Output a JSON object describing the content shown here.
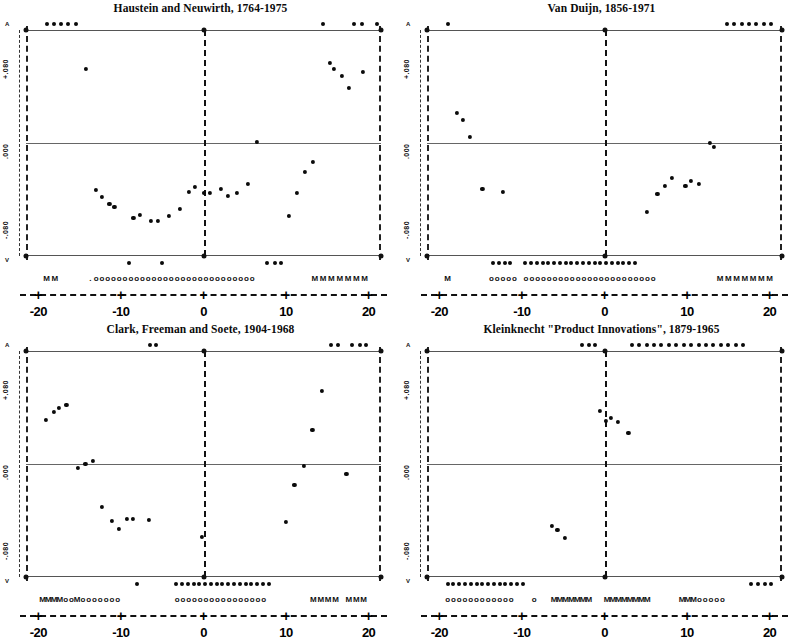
{
  "figure": {
    "panel_count": 4,
    "xlabel": "",
    "ylabel": ""
  },
  "axis": {
    "x_ticks": [
      "-20",
      "-10",
      "0",
      "10",
      "20"
    ],
    "x_tick_values": [
      -20,
      -10,
      0,
      10,
      20
    ],
    "x_tick_glyph": "+",
    "y_ticks": [
      "+.080",
      ".000",
      "-.080"
    ],
    "y_top_arrow": "A",
    "y_bottom_arrow": "V"
  },
  "chart_data": [
    {
      "type": "scatter",
      "title": "Haustein and Neuwirth, 1764-1975",
      "xlabel": "",
      "ylabel": "",
      "xlim": [
        -21.5,
        21.5
      ],
      "ylim": [
        -0.113,
        0.113
      ],
      "grid": false,
      "legend": "none",
      "gridlines_y": [
        0.08,
        0.0,
        -0.08
      ],
      "points": [
        {
          "x": -14.2,
          "y": 0.074
        },
        {
          "x": -13.0,
          "y": -0.047
        },
        {
          "x": -12.3,
          "y": -0.054
        },
        {
          "x": -11.4,
          "y": -0.061
        },
        {
          "x": -10.8,
          "y": -0.064
        },
        {
          "x": -8.5,
          "y": -0.075
        },
        {
          "x": -7.7,
          "y": -0.072
        },
        {
          "x": -6.4,
          "y": -0.078
        },
        {
          "x": -5.5,
          "y": -0.078
        },
        {
          "x": -4.2,
          "y": -0.073
        },
        {
          "x": -2.9,
          "y": -0.066
        },
        {
          "x": -1.8,
          "y": -0.049
        },
        {
          "x": -1.0,
          "y": -0.044
        },
        {
          "x": 0.0,
          "y": -0.05
        },
        {
          "x": 0.8,
          "y": -0.05
        },
        {
          "x": 2.1,
          "y": -0.046
        },
        {
          "x": 3.0,
          "y": -0.053
        },
        {
          "x": 4.0,
          "y": -0.05
        },
        {
          "x": 5.4,
          "y": -0.041
        },
        {
          "x": 6.5,
          "y": 0.001
        },
        {
          "x": 10.3,
          "y": -0.073
        },
        {
          "x": 11.3,
          "y": -0.05
        },
        {
          "x": 12.3,
          "y": -0.029
        },
        {
          "x": 13.3,
          "y": -0.019
        },
        {
          "x": 15.3,
          "y": 0.08
        },
        {
          "x": 15.8,
          "y": 0.074
        },
        {
          "x": 16.8,
          "y": 0.067
        },
        {
          "x": 17.6,
          "y": 0.055
        },
        {
          "x": 19.3,
          "y": 0.071
        }
      ],
      "clipped_above": [
        -19.0,
        -18.1,
        -17.3,
        -16.4,
        -15.4,
        14.5,
        18.2,
        19.2,
        21.0
      ],
      "clipped_below": [
        -9.0,
        -5.0,
        7.7,
        8.6,
        9.4
      ],
      "symbol_row": [
        {
          "x": -19.0,
          "s": "M"
        },
        {
          "x": -18.0,
          "s": "M"
        },
        {
          "x": -13.7,
          "s": "."
        },
        {
          "x": -13.0,
          "s": "o"
        },
        {
          "x": -12.3,
          "s": "o"
        },
        {
          "x": -11.6,
          "s": "o"
        },
        {
          "x": -10.9,
          "s": "o"
        },
        {
          "x": -10.2,
          "s": "o"
        },
        {
          "x": -9.5,
          "s": "o"
        },
        {
          "x": -8.8,
          "s": "o"
        },
        {
          "x": -8.1,
          "s": "o"
        },
        {
          "x": -7.4,
          "s": "o"
        },
        {
          "x": -6.7,
          "s": "o"
        },
        {
          "x": -6.0,
          "s": "o"
        },
        {
          "x": -5.3,
          "s": "o"
        },
        {
          "x": -4.6,
          "s": "o"
        },
        {
          "x": -3.9,
          "s": "o"
        },
        {
          "x": -3.2,
          "s": "o"
        },
        {
          "x": -2.5,
          "s": "o"
        },
        {
          "x": -1.8,
          "s": "o"
        },
        {
          "x": -1.1,
          "s": "o"
        },
        {
          "x": -0.4,
          "s": "o"
        },
        {
          "x": 0.3,
          "s": "o"
        },
        {
          "x": 1.0,
          "s": "o"
        },
        {
          "x": 1.7,
          "s": "o"
        },
        {
          "x": 2.4,
          "s": "o"
        },
        {
          "x": 3.1,
          "s": "o"
        },
        {
          "x": 3.8,
          "s": "o"
        },
        {
          "x": 4.5,
          "s": "o"
        },
        {
          "x": 5.2,
          "s": "o"
        },
        {
          "x": 5.9,
          "s": "o"
        },
        {
          "x": 13.5,
          "s": "M"
        },
        {
          "x": 14.5,
          "s": "M"
        },
        {
          "x": 15.5,
          "s": "M"
        },
        {
          "x": 16.5,
          "s": "M"
        },
        {
          "x": 17.5,
          "s": "M"
        },
        {
          "x": 18.5,
          "s": "M"
        },
        {
          "x": 19.5,
          "s": "M"
        }
      ]
    },
    {
      "type": "scatter",
      "title": "Van Duijn, 1856-1971",
      "xlabel": "",
      "ylabel": "",
      "xlim": [
        -21.5,
        21.5
      ],
      "ylim": [
        -0.113,
        0.113
      ],
      "grid": false,
      "legend": "none",
      "gridlines_y": [
        0.08,
        0.0,
        -0.08
      ],
      "points": [
        {
          "x": -17.9,
          "y": 0.03
        },
        {
          "x": -17.2,
          "y": 0.023
        },
        {
          "x": -16.3,
          "y": 0.006
        },
        {
          "x": -14.8,
          "y": -0.046
        },
        {
          "x": -12.3,
          "y": -0.049
        },
        {
          "x": 5.1,
          "y": -0.069
        },
        {
          "x": 6.4,
          "y": -0.051
        },
        {
          "x": 7.3,
          "y": -0.043
        },
        {
          "x": 8.2,
          "y": -0.035
        },
        {
          "x": 9.8,
          "y": -0.043
        },
        {
          "x": 10.5,
          "y": -0.038
        },
        {
          "x": 11.4,
          "y": -0.041
        },
        {
          "x": 12.8,
          "y": 0.0
        },
        {
          "x": 13.3,
          "y": -0.004
        }
      ],
      "clipped_above": [
        -19.0,
        14.8,
        15.7,
        16.6,
        17.5,
        18.4,
        19.3,
        20.2
      ],
      "clipped_below": [
        -13.5,
        -12.8,
        -12.1,
        -11.4,
        -9.6,
        -8.9,
        -8.2,
        -7.5,
        -6.8,
        -6.1,
        -5.4,
        -4.7,
        -4.0,
        -3.3,
        -2.6,
        -1.9,
        -1.2,
        -0.5,
        0.2,
        0.9,
        1.6,
        2.3,
        3.0,
        3.7
      ],
      "symbol_row": [
        {
          "x": -19.0,
          "s": "M"
        },
        {
          "x": -13.7,
          "s": "o"
        },
        {
          "x": -13.0,
          "s": "o"
        },
        {
          "x": -12.3,
          "s": "o"
        },
        {
          "x": -11.6,
          "s": "o"
        },
        {
          "x": -10.9,
          "s": "o"
        },
        {
          "x": -9.5,
          "s": "o"
        },
        {
          "x": -8.8,
          "s": "o"
        },
        {
          "x": -8.1,
          "s": "o"
        },
        {
          "x": -7.4,
          "s": "o"
        },
        {
          "x": -6.7,
          "s": "o"
        },
        {
          "x": -6.0,
          "s": "o"
        },
        {
          "x": -5.3,
          "s": "o"
        },
        {
          "x": -4.6,
          "s": "o"
        },
        {
          "x": -3.9,
          "s": "o"
        },
        {
          "x": -3.2,
          "s": "o"
        },
        {
          "x": -2.5,
          "s": "o"
        },
        {
          "x": -1.8,
          "s": "o"
        },
        {
          "x": -1.1,
          "s": "o"
        },
        {
          "x": -0.4,
          "s": "o"
        },
        {
          "x": 0.3,
          "s": "o"
        },
        {
          "x": 1.0,
          "s": "o"
        },
        {
          "x": 1.7,
          "s": "o"
        },
        {
          "x": 2.4,
          "s": "o"
        },
        {
          "x": 3.1,
          "s": "o"
        },
        {
          "x": 3.8,
          "s": "o"
        },
        {
          "x": 4.5,
          "s": "o"
        },
        {
          "x": 5.2,
          "s": "o"
        },
        {
          "x": 5.9,
          "s": "o"
        },
        {
          "x": 14.0,
          "s": "M"
        },
        {
          "x": 15.0,
          "s": "M"
        },
        {
          "x": 16.0,
          "s": "M"
        },
        {
          "x": 17.0,
          "s": "M"
        },
        {
          "x": 18.0,
          "s": "M"
        },
        {
          "x": 19.0,
          "s": "M"
        },
        {
          "x": 20.0,
          "s": "M"
        }
      ]
    },
    {
      "type": "scatter",
      "title": "Clark, Freeman and Soete, 1904-1968",
      "xlabel": "",
      "ylabel": "",
      "xlim": [
        -21.5,
        21.5
      ],
      "ylim": [
        -0.113,
        0.113
      ],
      "grid": false,
      "legend": "none",
      "gridlines_y": [
        0.08,
        0.0,
        -0.08
      ],
      "points": [
        {
          "x": -19.1,
          "y": 0.044
        },
        {
          "x": -18.1,
          "y": 0.052
        },
        {
          "x": -17.5,
          "y": 0.056
        },
        {
          "x": -16.6,
          "y": 0.059
        },
        {
          "x": -15.2,
          "y": -0.004
        },
        {
          "x": -14.3,
          "y": 0.0
        },
        {
          "x": -13.4,
          "y": 0.003
        },
        {
          "x": -12.3,
          "y": -0.043
        },
        {
          "x": -11.1,
          "y": -0.057
        },
        {
          "x": -10.2,
          "y": -0.065
        },
        {
          "x": -9.3,
          "y": -0.055
        },
        {
          "x": -8.6,
          "y": -0.055
        },
        {
          "x": -6.6,
          "y": -0.056
        },
        {
          "x": 10.0,
          "y": -0.058
        },
        {
          "x": 11.0,
          "y": -0.021
        },
        {
          "x": 12.2,
          "y": -0.002
        },
        {
          "x": 13.2,
          "y": 0.034
        },
        {
          "x": 14.3,
          "y": 0.073
        },
        {
          "x": 17.3,
          "y": -0.01
        },
        {
          "x": -0.2,
          "y": -0.073
        }
      ],
      "clipped_above": [
        -6.5,
        -5.7,
        15.5,
        16.3,
        18.0,
        18.9,
        19.7
      ],
      "clipped_below": [
        -8.0,
        -3.3,
        -2.6,
        -1.9,
        -1.2,
        -0.5,
        0.2,
        0.9,
        1.6,
        2.3,
        3.0,
        3.7,
        4.4,
        5.1,
        5.8,
        6.5,
        7.2,
        7.9
      ],
      "symbol_row": [
        {
          "x": -19.5,
          "s": "M"
        },
        {
          "x": -18.8,
          "s": "M"
        },
        {
          "x": -18.1,
          "s": "M"
        },
        {
          "x": -17.4,
          "s": "M"
        },
        {
          "x": -16.7,
          "s": "o"
        },
        {
          "x": -16.0,
          "s": "o"
        },
        {
          "x": -15.3,
          "s": "M"
        },
        {
          "x": -14.6,
          "s": "o"
        },
        {
          "x": -13.9,
          "s": "o"
        },
        {
          "x": -13.2,
          "s": "o"
        },
        {
          "x": -12.5,
          "s": "o"
        },
        {
          "x": -11.8,
          "s": "o"
        },
        {
          "x": -11.1,
          "s": "o"
        },
        {
          "x": -10.4,
          "s": "o"
        },
        {
          "x": -3.2,
          "s": "o"
        },
        {
          "x": -2.5,
          "s": "o"
        },
        {
          "x": -1.8,
          "s": "o"
        },
        {
          "x": -1.1,
          "s": "o"
        },
        {
          "x": -0.4,
          "s": "o"
        },
        {
          "x": 0.3,
          "s": "o"
        },
        {
          "x": 1.0,
          "s": "o"
        },
        {
          "x": 1.7,
          "s": "o"
        },
        {
          "x": 2.4,
          "s": "o"
        },
        {
          "x": 3.1,
          "s": "o"
        },
        {
          "x": 3.8,
          "s": "o"
        },
        {
          "x": 4.5,
          "s": "o"
        },
        {
          "x": 5.2,
          "s": "o"
        },
        {
          "x": 5.9,
          "s": "o"
        },
        {
          "x": 6.6,
          "s": "o"
        },
        {
          "x": 7.3,
          "s": "o"
        },
        {
          "x": 13.3,
          "s": "M"
        },
        {
          "x": 14.2,
          "s": "M"
        },
        {
          "x": 15.1,
          "s": "M"
        },
        {
          "x": 16.0,
          "s": "M"
        },
        {
          "x": 17.6,
          "s": "M"
        },
        {
          "x": 18.5,
          "s": "M"
        },
        {
          "x": 19.4,
          "s": "M"
        }
      ]
    },
    {
      "type": "scatter",
      "title": "Kleinknecht \"Product Innovations\", 1879-1965",
      "xlabel": "",
      "ylabel": "",
      "xlim": [
        -21.5,
        21.5
      ],
      "ylim": [
        -0.113,
        0.113
      ],
      "grid": false,
      "legend": "none",
      "gridlines_y": [
        0.08,
        0.0,
        -0.08
      ],
      "points": [
        {
          "x": -0.6,
          "y": 0.053
        },
        {
          "x": 0.2,
          "y": 0.043
        },
        {
          "x": 0.8,
          "y": 0.046
        },
        {
          "x": 1.6,
          "y": 0.042
        },
        {
          "x": 2.9,
          "y": 0.031
        },
        {
          "x": -6.4,
          "y": -0.062
        },
        {
          "x": -5.7,
          "y": -0.066
        },
        {
          "x": -4.8,
          "y": -0.074
        }
      ],
      "clipped_above": [
        -2.7,
        -1.9,
        -1.1,
        3.3,
        4.2,
        5.1,
        6.0,
        6.9,
        7.8,
        8.7,
        9.6,
        10.5,
        11.4,
        12.3,
        13.2,
        14.1,
        15.0,
        15.9,
        16.8
      ],
      "clipped_below": [
        -19.0,
        -18.3,
        -17.6,
        -16.9,
        -16.2,
        -15.5,
        -14.8,
        -14.1,
        -13.4,
        -12.7,
        -12.0,
        -11.3,
        -10.6,
        -9.9,
        17.8,
        18.6,
        19.4,
        20.2
      ],
      "symbol_row": [
        {
          "x": -19.0,
          "s": "o"
        },
        {
          "x": -18.3,
          "s": "o"
        },
        {
          "x": -17.6,
          "s": "o"
        },
        {
          "x": -16.9,
          "s": "o"
        },
        {
          "x": -16.2,
          "s": "o"
        },
        {
          "x": -15.5,
          "s": "o"
        },
        {
          "x": -14.8,
          "s": "o"
        },
        {
          "x": -14.1,
          "s": "o"
        },
        {
          "x": -13.4,
          "s": "o"
        },
        {
          "x": -12.7,
          "s": "o"
        },
        {
          "x": -12.0,
          "s": "o"
        },
        {
          "x": -11.3,
          "s": "o"
        },
        {
          "x": -8.5,
          "s": "o"
        },
        {
          "x": -6.1,
          "s": "M"
        },
        {
          "x": -5.4,
          "s": "M"
        },
        {
          "x": -4.7,
          "s": "M"
        },
        {
          "x": -4.0,
          "s": "M"
        },
        {
          "x": -3.3,
          "s": "M"
        },
        {
          "x": -2.6,
          "s": "M"
        },
        {
          "x": -1.9,
          "s": "M"
        },
        {
          "x": 0.3,
          "s": "M"
        },
        {
          "x": 1.0,
          "s": "M"
        },
        {
          "x": 1.7,
          "s": "M"
        },
        {
          "x": 2.4,
          "s": "M"
        },
        {
          "x": 3.1,
          "s": "M"
        },
        {
          "x": 3.8,
          "s": "M"
        },
        {
          "x": 4.5,
          "s": "M"
        },
        {
          "x": 5.2,
          "s": "M"
        },
        {
          "x": 9.4,
          "s": "M"
        },
        {
          "x": 10.1,
          "s": "M"
        },
        {
          "x": 10.8,
          "s": "M"
        },
        {
          "x": 11.5,
          "s": "o"
        },
        {
          "x": 12.2,
          "s": "o"
        },
        {
          "x": 12.9,
          "s": "o"
        },
        {
          "x": 13.6,
          "s": "o"
        },
        {
          "x": 14.3,
          "s": "o"
        }
      ]
    }
  ]
}
